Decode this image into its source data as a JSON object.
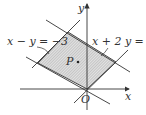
{
  "diagram": {
    "type": "linear-inequality-region",
    "axis_labels": {
      "x": "x",
      "y": "y",
      "origin": "O"
    },
    "point_label": "P",
    "lines": [
      {
        "id": "l1",
        "label": "x − y = −3",
        "equation": "x - y = -3"
      },
      {
        "id": "l2",
        "label": "x + 2 y = 3",
        "equation": "x + 2y = 3"
      },
      {
        "id": "l3",
        "label": "",
        "equation": "x + 2y = 0"
      },
      {
        "id": "l4",
        "label": "",
        "equation": "x - y = 0"
      }
    ],
    "region": "shaded parallelogram bounded by the four lines",
    "colors": {
      "line": "#333333",
      "hatch": "#888888",
      "fill": "#d8d8d8"
    }
  }
}
